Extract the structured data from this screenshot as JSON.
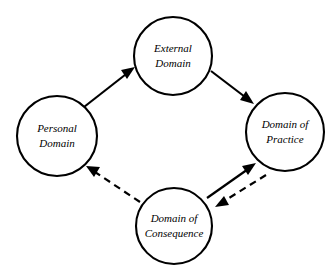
{
  "diagram": {
    "background_color": "#ffffff",
    "stroke_color": "#000000",
    "nodes": [
      {
        "id": "personal-domain",
        "line1": "Personal",
        "line2": "Domain",
        "cx": 57,
        "cy": 136,
        "r": 40
      },
      {
        "id": "external-domain",
        "line1": "External",
        "line2": "Domain",
        "cx": 173,
        "cy": 56,
        "r": 39
      },
      {
        "id": "domain-of-practice",
        "line1": "Domain of",
        "line2": "Practice",
        "cx": 285,
        "cy": 132,
        "r": 39
      },
      {
        "id": "domain-of-consequence",
        "line1": "Domain of",
        "line2": "Consequence",
        "cx": 174,
        "cy": 226,
        "r": 38
      }
    ],
    "edges": [
      {
        "id": "personal-to-external",
        "from": "personal-domain",
        "to": "external-domain",
        "style": "solid",
        "arrow": "end",
        "x1": 84,
        "y1": 107,
        "x2": 135,
        "y2": 67
      },
      {
        "id": "external-to-practice",
        "from": "external-domain",
        "to": "domain-of-practice",
        "style": "solid",
        "arrow": "end",
        "x1": 211,
        "y1": 71,
        "x2": 254,
        "y2": 104
      },
      {
        "id": "consequence-to-practice",
        "from": "domain-of-consequence",
        "to": "domain-of-practice",
        "style": "solid",
        "arrow": "end",
        "x1": 207,
        "y1": 198,
        "x2": 256,
        "y2": 163
      },
      {
        "id": "practice-to-consequence",
        "from": "domain-of-practice",
        "to": "domain-of-consequence",
        "style": "dashed",
        "arrow": "end",
        "x1": 266,
        "y1": 175,
        "x2": 215,
        "y2": 207
      },
      {
        "id": "consequence-to-personal",
        "from": "domain-of-consequence",
        "to": "personal-domain",
        "style": "dashed",
        "arrow": "end",
        "x1": 140,
        "y1": 202,
        "x2": 86,
        "y2": 166
      }
    ]
  }
}
